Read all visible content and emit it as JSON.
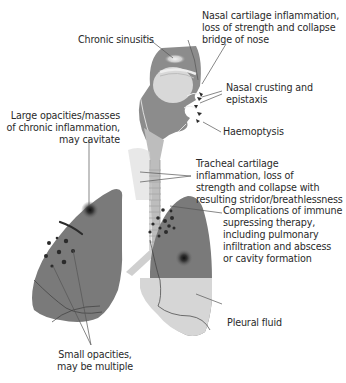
{
  "figure": {
    "colors": {
      "tissue_dark": "#7a7a7a",
      "tissue_mid": "#9a9a9a",
      "tissue_light": "#d9d9d9",
      "fluid": "#d6d6d6",
      "trachea": "#cfcfcf",
      "lesion": "#2b2b2b",
      "leader_line": "#555555",
      "text": "#2a2a2a"
    }
  },
  "labels": {
    "nasal_cartilage": [
      "Nasal cartilage inflammation,",
      "loss of strength and collapse",
      "bridge of nose"
    ],
    "chronic_sinusitis": [
      "Chronic sinusitis"
    ],
    "nasal_crusting": [
      "Nasal crusting and",
      "epistaxis"
    ],
    "large_opacities": [
      "Large opacities/masses",
      "of chronic inflammation,",
      "may cavitate"
    ],
    "haemoptysis": [
      "Haemoptysis"
    ],
    "tracheal_cartilage": [
      "Tracheal cartilage",
      "inflammation, loss of",
      "strength and collapse with",
      "resulting stridor/breathlessness"
    ],
    "immune_complications": [
      "Complications of immune",
      "supressing therapy,",
      "including pulmonary",
      "infiltration and abscess",
      "or cavity formation"
    ],
    "pleural_fluid": [
      "Pleural fluid"
    ],
    "small_opacities": [
      "Small opacities,",
      "may be multiple"
    ]
  }
}
